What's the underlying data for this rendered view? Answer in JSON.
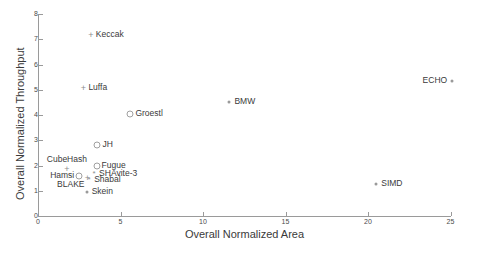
{
  "chart_data": {
    "type": "scatter",
    "title": "",
    "xlabel": "Overall Normalized Area",
    "ylabel": "Overall Normalized Throughput",
    "xlim": [
      0,
      25
    ],
    "ylim": [
      0,
      8
    ],
    "xticks": [
      "0",
      "5",
      "10",
      "15",
      "20",
      "25"
    ],
    "yticks": [
      "0",
      "1",
      "2",
      "3",
      "4",
      "5",
      "6",
      "7",
      "8"
    ],
    "grid": false,
    "legend": "none",
    "points": [
      {
        "label": "Keccak",
        "x": 3.2,
        "y": 7.15,
        "marker": "plus",
        "label_pos": "right"
      },
      {
        "label": "Luffa",
        "x": 2.75,
        "y": 5.05,
        "marker": "plus",
        "label_pos": "right"
      },
      {
        "label": "ECHO",
        "x": 25.1,
        "y": 5.35,
        "marker": "dot",
        "label_pos": "left"
      },
      {
        "label": "BMW",
        "x": 11.6,
        "y": 4.5,
        "marker": "dot",
        "label_pos": "right"
      },
      {
        "label": "Groestl",
        "x": 5.6,
        "y": 4.05,
        "marker": "circle",
        "label_pos": "right"
      },
      {
        "label": "JH",
        "x": 3.6,
        "y": 2.8,
        "marker": "circle",
        "label_pos": "right"
      },
      {
        "label": "CubeHash",
        "x": 1.75,
        "y": 1.85,
        "marker": "plus",
        "label_pos": "above"
      },
      {
        "label": "Fugue",
        "x": 3.55,
        "y": 2.0,
        "marker": "circle",
        "label_pos": "right"
      },
      {
        "label": "Hamsi",
        "x": 2.5,
        "y": 1.6,
        "marker": "circle",
        "label_pos": "left"
      },
      {
        "label": "SHAvite-3",
        "x": 3.4,
        "y": 1.68,
        "marker": "star",
        "label_pos": "right"
      },
      {
        "label": "BLAKE",
        "x": 3.0,
        "y": 1.5,
        "marker": "plus",
        "label_pos": "belowleft"
      },
      {
        "label": "Shabal",
        "x": 3.1,
        "y": 1.42,
        "marker": "star",
        "label_pos": "right"
      },
      {
        "label": "SIMD",
        "x": 20.5,
        "y": 1.25,
        "marker": "dot",
        "label_pos": "right"
      },
      {
        "label": "Skein",
        "x": 2.95,
        "y": 0.95,
        "marker": "dot",
        "label_pos": "right"
      }
    ]
  },
  "axes": {
    "xlabel": "Overall Normalized Area",
    "ylabel": "Overall Normalized Throughput"
  }
}
